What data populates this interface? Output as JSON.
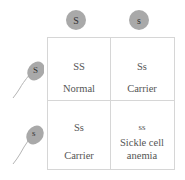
{
  "eggs": [
    {
      "allele": "S"
    },
    {
      "allele": "s"
    }
  ],
  "sperm": [
    {
      "allele": "S"
    },
    {
      "allele": "s"
    }
  ],
  "cells": [
    {
      "genotype": "SS",
      "phenotype": "Normal"
    },
    {
      "genotype": "Ss",
      "phenotype": "Carrier"
    },
    {
      "genotype": "Ss",
      "phenotype": "Carrier"
    },
    {
      "genotype": "ss",
      "phenotype": "Sickle cell anemia"
    }
  ],
  "colors": {
    "gamete": "#a9a9a9",
    "grid_line": "#d6d6d6",
    "text": "#555555"
  }
}
